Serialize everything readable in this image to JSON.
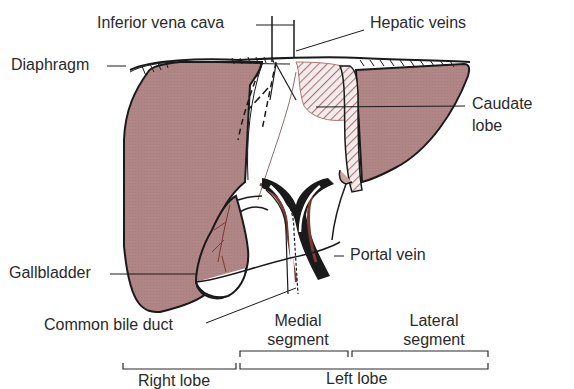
{
  "colors": {
    "liver_tissue": "#b08585",
    "outline": "#1a1a1a",
    "label_text": "#2a2a2a",
    "artery_red": "#7a3a35",
    "background": "#ffffff"
  },
  "labels": {
    "inferior_vena_cava": "Inferior vena cava",
    "hepatic_veins": "Hepatic veins",
    "diaphragm": "Diaphragm",
    "caudate_lobe_line1": "Caudate",
    "caudate_lobe_line2": "lobe",
    "gallbladder": "Gallbladder",
    "portal_vein": "Portal vein",
    "common_bile_duct": "Common bile duct",
    "medial_segment_line1": "Medial",
    "medial_segment_line2": "segment",
    "lateral_segment_line1": "Lateral",
    "lateral_segment_line2": "segment",
    "right_lobe": "Right lobe",
    "left_lobe": "Left lobe"
  }
}
